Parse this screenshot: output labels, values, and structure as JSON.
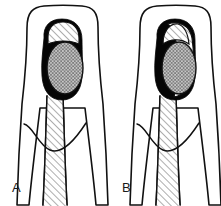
{
  "figure": {
    "domain": "medical-dental-line-illustration",
    "width": 221,
    "height": 206,
    "background_color": "#ffffff",
    "ink_color": "#111111",
    "fill_black": "#050505",
    "hatch_color": "#555555",
    "panel_count": 2,
    "description_visible_text_only": true
  },
  "panels": [
    {
      "id": "A",
      "label": "A",
      "label_x": 12,
      "label_y": 192,
      "side": "left",
      "parts": {
        "crown_outline": "rounded trapezoid crown",
        "pulp_chamber_fill": "black with crosshatched core",
        "pulp_core_pattern": "crosshatch",
        "coronal_wedge_pattern": "diagonal-hatch",
        "root_canal_pattern": "diagonal-hatch",
        "cej_curve": "concave-up curve across root"
      }
    },
    {
      "id": "B",
      "label": "B",
      "label_x": 122,
      "label_y": 192,
      "side": "right",
      "parts": {
        "crown_outline": "rounded trapezoid crown",
        "pulp_chamber_fill": "black crescent on mesial side with crosshatched core",
        "pulp_core_pattern": "crosshatch",
        "coronal_wedge_pattern": "diagonal-hatch",
        "root_canal_pattern": "diagonal-hatch",
        "cej_curve": "concave-up curve across root"
      }
    }
  ],
  "legend": {
    "black_region": "black-filled region",
    "crosshatch_region": "crosshatched region",
    "diagonal_hatch_region": "diagonally hatched region"
  }
}
